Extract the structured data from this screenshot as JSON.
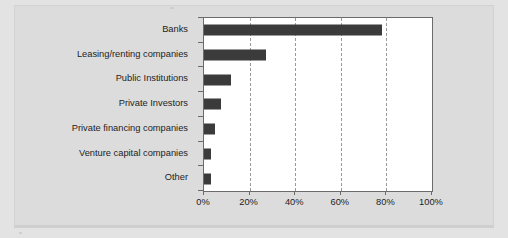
{
  "chart_data": {
    "type": "bar",
    "orientation": "horizontal",
    "title": "",
    "subtitle": "",
    "xlabel": "",
    "ylabel": "",
    "categories": [
      "Banks",
      "Leasing/renting companies",
      "Public Institutions",
      "Private Investors",
      "Private financing companies",
      "Venture capital companies",
      "Other"
    ],
    "values": [
      78,
      27,
      12,
      7.5,
      5,
      3,
      3
    ],
    "xlim": [
      0,
      100
    ],
    "xticks": [
      0,
      20,
      40,
      60,
      80,
      100
    ],
    "xticklabels": [
      "0%",
      "20%",
      "40%",
      "60%",
      "80%",
      "100%"
    ],
    "grid": "vertical-dashed",
    "legend": "none",
    "bar_color": "#3b3b3b",
    "plot_background": "#ffffff",
    "figure_background": "#dcdcdc",
    "axis_color": "#6b6b6b",
    "gridline_color": "#9a9a9a"
  }
}
